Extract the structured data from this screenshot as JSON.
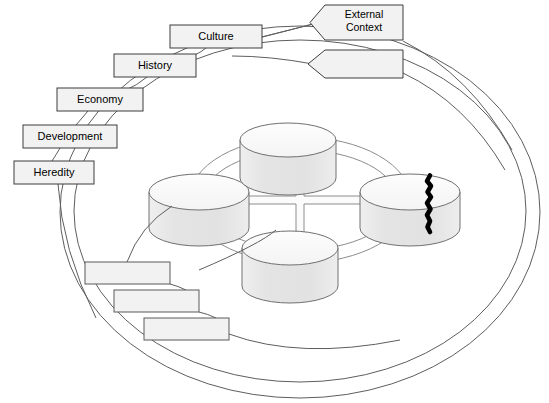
{
  "diagram": {
    "canvas": {
      "width": 549,
      "height": 403,
      "background": "#ffffff"
    },
    "style": {
      "stroke": "#595959",
      "box_stroke": "#4d4d4d",
      "box_fill": "#f2f2f2",
      "cylinder_body_fill": "#e6e6e6",
      "cylinder_top_fill": "#fafafa",
      "crack_color": "#000000",
      "connector_stroke": "#808080"
    },
    "outer_boundary": {
      "name": "outer-context-ellipse",
      "type": "double-ellipse",
      "cx": 300,
      "cy": 212,
      "rx_outer": 240,
      "ry_outer": 185,
      "rx_inner": 228,
      "ry_inner": 172
    },
    "inner_ring": {
      "name": "inner-connector-ring",
      "type": "double-ellipse",
      "cx": 300,
      "cy": 200,
      "rx_outer": 110,
      "ry_outer": 62,
      "rx_inner": 98,
      "ry_inner": 52
    },
    "cross_connector": {
      "name": "central-cross-connector",
      "orientation": "plus",
      "vertical_span": [
        160,
        262
      ],
      "horizontal_span": [
        210,
        392
      ]
    },
    "cylinders": [
      {
        "id": "cylinder-top",
        "position": "top",
        "label": "",
        "cx": 288,
        "cy": 140,
        "rx": 48,
        "ry": 17,
        "body_height": 38,
        "cracked": false
      },
      {
        "id": "cylinder-left",
        "position": "left",
        "label": "",
        "cx": 199,
        "cy": 192,
        "rx": 50,
        "ry": 18,
        "body_height": 36,
        "cracked": false
      },
      {
        "id": "cylinder-bottom",
        "position": "bottom",
        "label": "",
        "cx": 290,
        "cy": 248,
        "rx": 48,
        "ry": 17,
        "body_height": 38,
        "cracked": false
      },
      {
        "id": "cylinder-right",
        "position": "right",
        "label": "",
        "cx": 410,
        "cy": 192,
        "rx": 50,
        "ry": 18,
        "body_height": 36,
        "cracked": true,
        "crack_note": "black jagged fissure splitting the cylinder vertically"
      }
    ],
    "labels": [
      {
        "id": "label-culture",
        "text": "Culture",
        "x": 170,
        "y": 25,
        "width": 92,
        "height": 23,
        "shape": "rect",
        "lines": [
          "Culture"
        ]
      },
      {
        "id": "label-history",
        "text": "History",
        "x": 114,
        "y": 54,
        "width": 82,
        "height": 23,
        "shape": "rect",
        "lines": [
          "History"
        ]
      },
      {
        "id": "label-economy",
        "text": "Economy",
        "x": 57,
        "y": 88,
        "width": 86,
        "height": 23,
        "shape": "rect",
        "lines": [
          "Economy"
        ]
      },
      {
        "id": "label-development",
        "text": "Development",
        "x": 23,
        "y": 125,
        "width": 94,
        "height": 23,
        "shape": "rect",
        "lines": [
          "Development"
        ]
      },
      {
        "id": "label-heredity",
        "text": "Heredity",
        "x": 14,
        "y": 161,
        "width": 80,
        "height": 23,
        "shape": "rect",
        "lines": [
          "Heredity"
        ]
      },
      {
        "id": "label-external-context",
        "text": "External Context",
        "x": 325,
        "y": 5,
        "width": 78,
        "height": 35,
        "shape": "arrow-left",
        "lines": [
          "External",
          "Context"
        ]
      },
      {
        "id": "label-external-context-empty",
        "text": "",
        "x": 325,
        "y": 50,
        "width": 78,
        "height": 28,
        "shape": "arrow-left",
        "lines": []
      },
      {
        "id": "label-blank-1",
        "text": "",
        "x": 85,
        "y": 262,
        "width": 85,
        "height": 22,
        "shape": "rect",
        "lines": []
      },
      {
        "id": "label-blank-2",
        "text": "",
        "x": 114,
        "y": 290,
        "width": 85,
        "height": 22,
        "shape": "rect",
        "lines": []
      },
      {
        "id": "label-blank-3",
        "text": "",
        "x": 144,
        "y": 318,
        "width": 85,
        "height": 22,
        "shape": "rect",
        "lines": []
      }
    ],
    "leader_lines": [
      {
        "id": "leader-culture-history",
        "from": "label-culture",
        "to": "label-history"
      },
      {
        "id": "leader-history-economy",
        "from": "label-history",
        "to": "label-economy"
      },
      {
        "id": "leader-economy-development",
        "from": "label-economy",
        "to": "label-development"
      },
      {
        "id": "leader-development-heredity",
        "from": "label-development",
        "to": "label-heredity"
      },
      {
        "id": "leader-heredity-boundary",
        "from": "label-heredity",
        "to": "outer-context-ellipse"
      },
      {
        "id": "leader-culture-external",
        "from": "label-culture",
        "to": "label-external-context"
      },
      {
        "id": "leader-external-boundary",
        "from": "label-external-context-empty",
        "to": "outer-context-ellipse"
      },
      {
        "id": "leader-blank1-blank2",
        "from": "label-blank-1",
        "to": "label-blank-2"
      },
      {
        "id": "leader-blank2-blank3",
        "from": "label-blank-2",
        "to": "label-blank-3"
      },
      {
        "id": "leader-blank1-ring",
        "from": "label-blank-1",
        "to": "inner-connector-ring"
      },
      {
        "id": "leader-blank3-boundary",
        "from": "label-blank-3",
        "to": "outer-context-ellipse"
      }
    ]
  }
}
